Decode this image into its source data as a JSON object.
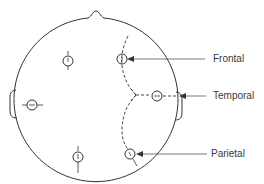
{
  "diagram": {
    "labels": {
      "frontal": "Frontal",
      "temporal": "Temporal",
      "parietal": "Parietal"
    },
    "colors": {
      "line": "#333333",
      "background": "#ffffff"
    }
  }
}
